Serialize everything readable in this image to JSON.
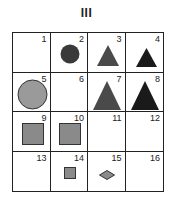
{
  "title": "III",
  "grid": {
    "rows": 4,
    "cols": 4,
    "cells": [
      {
        "number": "1",
        "shape": null
      },
      {
        "number": "2",
        "shape": {
          "type": "circle",
          "size": "medium",
          "fill": "#3a3a3a"
        }
      },
      {
        "number": "3",
        "shape": {
          "type": "triangle",
          "size": "small",
          "fill": "#4a4a4a"
        }
      },
      {
        "number": "4",
        "shape": {
          "type": "triangle",
          "size": "small",
          "fill": "#1a1a1a"
        }
      },
      {
        "number": "5",
        "shape": {
          "type": "circle",
          "size": "large",
          "fill": "#9a9a9a"
        }
      },
      {
        "number": "6",
        "shape": null
      },
      {
        "number": "7",
        "shape": {
          "type": "triangle",
          "size": "large",
          "fill": "#4a4a4a"
        }
      },
      {
        "number": "8",
        "shape": {
          "type": "triangle",
          "size": "large",
          "fill": "#1a1a1a"
        }
      },
      {
        "number": "9",
        "shape": {
          "type": "square",
          "size": "large",
          "fill": "#8a8a8a"
        }
      },
      {
        "number": "10",
        "shape": {
          "type": "square",
          "size": "large",
          "fill": "#8a8a8a"
        }
      },
      {
        "number": "11",
        "shape": null
      },
      {
        "number": "12",
        "shape": null
      },
      {
        "number": "13",
        "shape": null
      },
      {
        "number": "14",
        "shape": {
          "type": "square",
          "size": "small",
          "fill": "#8a8a8a"
        }
      },
      {
        "number": "15",
        "shape": {
          "type": "diamond",
          "size": "small",
          "fill": "#8a8a8a"
        }
      },
      {
        "number": "16",
        "shape": null
      }
    ]
  }
}
